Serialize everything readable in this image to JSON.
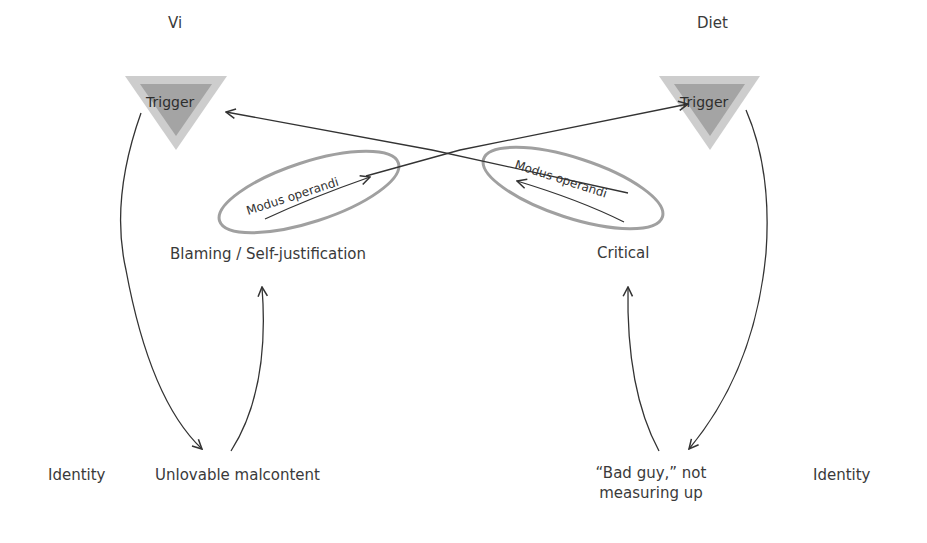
{
  "left": {
    "title": "Vi",
    "trigger": "Trigger",
    "modus": "Modus operandi",
    "behavior": "Blaming / Self-justification",
    "identity_label": "Identity",
    "identity_value": "Unlovable malcontent"
  },
  "right": {
    "title": "Diet",
    "trigger": "Trigger",
    "modus": "Modus operandi",
    "behavior": "Critical",
    "identity_label": "Identity",
    "identity_value_line1": "“Bad guy,” not",
    "identity_value_line2": "measuring up"
  },
  "colors": {
    "triangle_outer": "#c8c8c8",
    "triangle_inner": "#9a9a9a",
    "ellipse_stroke": "#9a9a9a",
    "arrow": "#333333"
  }
}
